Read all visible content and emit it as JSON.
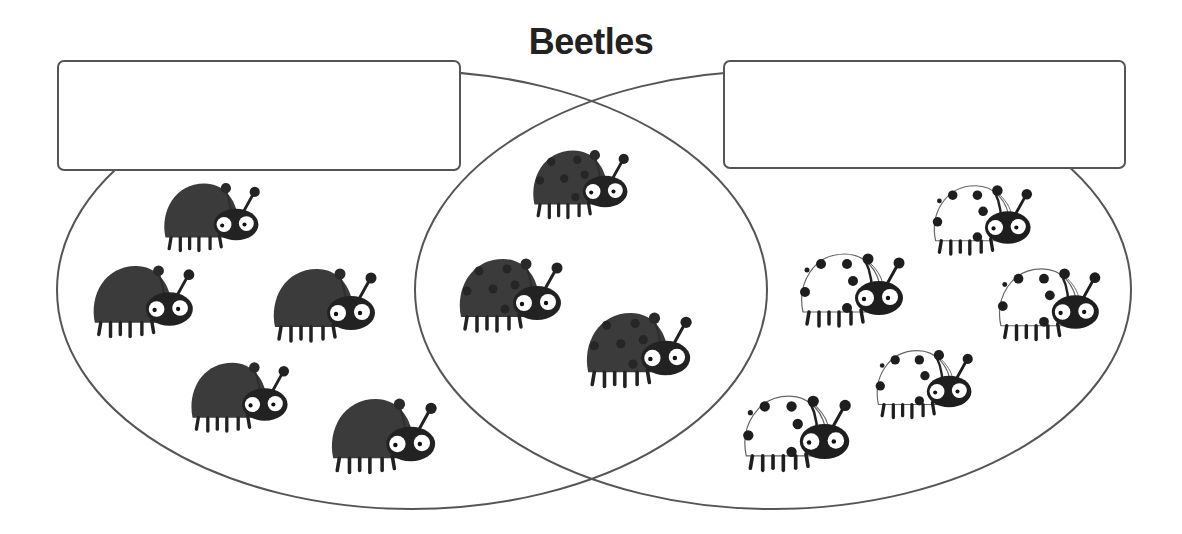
{
  "title": "Beetles",
  "colors": {
    "outline": "#555555",
    "dark_shell": "#3b3b3b",
    "head": "#222222",
    "white_shell": "#ffffff",
    "spot": "#1e1e1e"
  },
  "venn": {
    "left_set": {
      "label_box_text": "",
      "ellipse": {
        "cx": 412,
        "cy": 290,
        "rx": 355,
        "ry": 219
      },
      "beetle_type": "dark-no-spots",
      "count": 5
    },
    "right_set": {
      "label_box_text": "",
      "ellipse": {
        "cx": 773,
        "cy": 290,
        "rx": 358,
        "ry": 219
      },
      "beetle_type": "white-with-spots",
      "count": 5
    },
    "intersection": {
      "beetle_type": "dark-with-spots",
      "count": 3
    }
  },
  "beetles": [
    {
      "region": "left",
      "type": "dark",
      "x": 163,
      "y": 183
    },
    {
      "region": "left",
      "type": "dark",
      "x": 92,
      "y": 265
    },
    {
      "region": "left",
      "type": "dark",
      "x": 272,
      "y": 268
    },
    {
      "region": "left",
      "type": "dark",
      "x": 190,
      "y": 362
    },
    {
      "region": "left",
      "type": "dark",
      "x": 330,
      "y": 398
    },
    {
      "region": "middle",
      "type": "dark-spotted",
      "x": 532,
      "y": 150
    },
    {
      "region": "middle",
      "type": "dark-spotted",
      "x": 458,
      "y": 258
    },
    {
      "region": "middle",
      "type": "dark-spotted",
      "x": 585,
      "y": 312
    },
    {
      "region": "right",
      "type": "white-spotted",
      "x": 933,
      "y": 185
    },
    {
      "region": "right",
      "type": "white-spotted",
      "x": 800,
      "y": 253
    },
    {
      "region": "right",
      "type": "white-spotted",
      "x": 998,
      "y": 268
    },
    {
      "region": "right",
      "type": "white-spotted",
      "x": 876,
      "y": 350
    },
    {
      "region": "right",
      "type": "white-spotted",
      "x": 743,
      "y": 395
    }
  ]
}
